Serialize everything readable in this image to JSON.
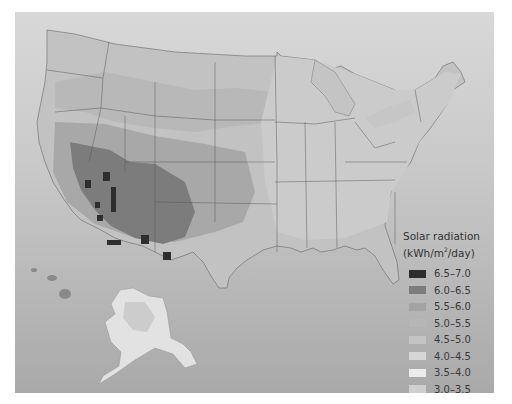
{
  "map": {
    "subject": "Solar radiation across the United States",
    "regions_shown": [
      "Contiguous United States",
      "Alaska",
      "Hawaii"
    ],
    "background_color": "#c8c8c8"
  },
  "legend": {
    "title_line1": "Solar radiation",
    "title_line2_pre": "(kWh/m",
    "title_sup": "2",
    "title_line2_post": "/day)",
    "items": [
      {
        "label": "6.5–7.0",
        "color": "#2e2e2e"
      },
      {
        "label": "6.0–6.5",
        "color": "#7c7c7c"
      },
      {
        "label": "5.5–6.0",
        "color": "#a4a4a4"
      },
      {
        "label": "5.0–5.5",
        "color": "#b6b6b6"
      },
      {
        "label": "4.5–5.0",
        "color": "#c4c4c4"
      },
      {
        "label": "4.0–4.5",
        "color": "#d6d6d6"
      },
      {
        "label": "3.5–4.0",
        "color": "#ececec"
      },
      {
        "label": "3.0–3.5",
        "color": "#cfcfcf"
      }
    ]
  }
}
